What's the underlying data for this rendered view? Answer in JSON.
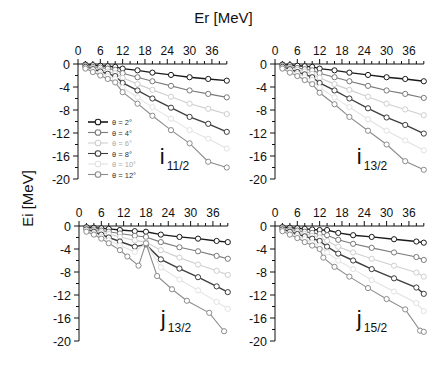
{
  "figure": {
    "xlabel": "Er [MeV]",
    "ylabel": "Ei [MeV]"
  },
  "chart_data": [
    {
      "type": "line",
      "panel": "top-left",
      "title": "i11/2",
      "label_main": "i",
      "label_sub": "11/2",
      "xlabel": "Er [MeV]",
      "ylabel": "Ei [MeV]",
      "xlim": [
        0,
        40
      ],
      "ylim": [
        -20,
        0
      ],
      "xticks": [
        0,
        6,
        12,
        18,
        24,
        30,
        36
      ],
      "yticks": [
        0,
        -4,
        -8,
        -12,
        -16,
        -20
      ],
      "legend": [
        "θ = 2°",
        "θ = 4°",
        "θ = 6°",
        "θ = 8°",
        "θ = 10°",
        "θ = 12°"
      ],
      "series": [
        {
          "name": "θ = 2°",
          "x": [
            2,
            4,
            6,
            8,
            10,
            12,
            16,
            20,
            25,
            30,
            35,
            40
          ],
          "y": [
            -0.1,
            -0.2,
            -0.3,
            -0.4,
            -0.5,
            -0.8,
            -1.1,
            -1.5,
            -1.9,
            -2.3,
            -2.6,
            -2.9
          ]
        },
        {
          "name": "θ = 4°",
          "x": [
            2,
            4,
            6,
            8,
            10,
            12,
            16,
            20,
            25,
            30,
            35,
            40
          ],
          "y": [
            -0.3,
            -0.5,
            -0.6,
            -0.8,
            -1.0,
            -1.6,
            -2.3,
            -3.0,
            -3.8,
            -4.6,
            -5.2,
            -5.8
          ]
        },
        {
          "name": "θ = 6°",
          "x": [
            2,
            4,
            6,
            8,
            10,
            12,
            16,
            20,
            25,
            30,
            35,
            40
          ],
          "y": [
            -0.4,
            -0.7,
            -1.0,
            -1.3,
            -1.6,
            -2.4,
            -3.5,
            -4.5,
            -5.7,
            -6.9,
            -7.8,
            -8.7
          ]
        },
        {
          "name": "θ = 8°",
          "x": [
            2,
            4,
            6,
            8,
            10,
            12,
            16,
            20,
            25,
            30,
            35,
            40
          ],
          "y": [
            -0.5,
            -0.9,
            -1.3,
            -1.7,
            -2.1,
            -3.3,
            -4.6,
            -6.0,
            -7.6,
            -9.2,
            -10.4,
            -11.8
          ]
        },
        {
          "name": "θ = 10°",
          "x": [
            2,
            4,
            6,
            8,
            10,
            12,
            16,
            20,
            25,
            30,
            35,
            40
          ],
          "y": [
            -0.7,
            -1.1,
            -1.6,
            -2.1,
            -2.6,
            -4.1,
            -5.8,
            -7.5,
            -9.5,
            -11.5,
            -13.0,
            -14.7
          ]
        },
        {
          "name": "θ = 12°",
          "x": [
            2,
            4,
            6,
            8,
            10,
            12,
            16,
            20,
            25,
            30,
            35,
            40
          ],
          "y": [
            -0.8,
            -1.4,
            -2.0,
            -2.6,
            -3.2,
            -4.9,
            -6.9,
            -9.0,
            -11.5,
            -13.8,
            -17.0,
            -18.0
          ]
        }
      ]
    },
    {
      "type": "line",
      "panel": "top-right",
      "title": "i13/2",
      "label_main": "i",
      "label_sub": "13/2",
      "xlabel": "Er [MeV]",
      "ylabel": "Ei [MeV]",
      "xlim": [
        0,
        40
      ],
      "ylim": [
        -20,
        0
      ],
      "xticks": [
        0,
        6,
        12,
        18,
        24,
        30,
        36
      ],
      "yticks": [
        0,
        -4,
        -8,
        -12,
        -16,
        -20
      ],
      "series": [
        {
          "name": "θ = 2°",
          "x": [
            2,
            4,
            6,
            8,
            10,
            12,
            16,
            20,
            25,
            30,
            35,
            40
          ],
          "y": [
            -0.1,
            -0.2,
            -0.3,
            -0.4,
            -0.5,
            -0.8,
            -1.1,
            -1.5,
            -1.9,
            -2.3,
            -2.6,
            -3.0
          ]
        },
        {
          "name": "θ = 4°",
          "x": [
            2,
            4,
            6,
            8,
            10,
            12,
            16,
            20,
            25,
            30,
            35,
            40
          ],
          "y": [
            -0.3,
            -0.5,
            -0.7,
            -0.9,
            -1.1,
            -1.6,
            -2.3,
            -3.0,
            -3.8,
            -4.6,
            -5.2,
            -5.9
          ]
        },
        {
          "name": "θ = 6°",
          "x": [
            2,
            4,
            6,
            8,
            10,
            12,
            16,
            20,
            25,
            30,
            35,
            40
          ],
          "y": [
            -0.4,
            -0.7,
            -1.0,
            -1.3,
            -1.7,
            -2.4,
            -3.5,
            -4.5,
            -5.7,
            -6.9,
            -7.9,
            -8.9
          ]
        },
        {
          "name": "θ = 8°",
          "x": [
            2,
            4,
            6,
            8,
            10,
            12,
            16,
            20,
            25,
            30,
            35,
            40
          ],
          "y": [
            -0.5,
            -0.9,
            -1.4,
            -1.8,
            -2.3,
            -3.3,
            -4.6,
            -6.0,
            -7.7,
            -9.3,
            -10.6,
            -12.1
          ]
        },
        {
          "name": "θ = 10°",
          "x": [
            2,
            4,
            6,
            8,
            10,
            12,
            16,
            20,
            25,
            30,
            35,
            40
          ],
          "y": [
            -0.7,
            -1.2,
            -1.7,
            -2.3,
            -2.8,
            -4.1,
            -5.8,
            -7.5,
            -9.6,
            -11.6,
            -13.3,
            -15.0
          ]
        },
        {
          "name": "θ = 12°",
          "x": [
            2,
            4,
            6,
            8,
            10,
            12,
            16,
            20,
            25,
            30,
            35,
            40
          ],
          "y": [
            -0.8,
            -1.5,
            -2.1,
            -2.8,
            -3.5,
            -5.0,
            -7.0,
            -9.2,
            -11.6,
            -14.0,
            -16.9,
            -18.4
          ]
        }
      ]
    },
    {
      "type": "line",
      "panel": "bottom-left",
      "title": "j13/2",
      "label_main": "j",
      "label_sub": "13/2",
      "xlabel": "Er [MeV]",
      "ylabel": "Ei [MeV]",
      "xlim": [
        0,
        40
      ],
      "ylim": [
        -20,
        0
      ],
      "xticks": [
        0,
        6,
        12,
        18,
        24,
        30,
        36
      ],
      "yticks": [
        0,
        -4,
        -8,
        -12,
        -16,
        -20
      ],
      "series": [
        {
          "name": "θ = 2°",
          "x": [
            2,
            4,
            6,
            8,
            11,
            15,
            18,
            22,
            27,
            32,
            37,
            40
          ],
          "y": [
            -0.2,
            -0.3,
            -0.4,
            -0.5,
            -0.7,
            -0.9,
            -1.0,
            -1.5,
            -1.9,
            -2.2,
            -2.6,
            -2.8
          ]
        },
        {
          "name": "θ = 4°",
          "x": [
            2,
            4,
            6,
            8,
            11,
            15,
            18,
            22,
            27,
            32,
            37,
            40
          ],
          "y": [
            -0.4,
            -0.6,
            -0.8,
            -1.0,
            -1.3,
            -1.7,
            -1.9,
            -2.8,
            -3.7,
            -4.4,
            -5.2,
            -5.7
          ]
        },
        {
          "name": "θ = 6°",
          "x": [
            2,
            4,
            6,
            8,
            11,
            15,
            18,
            22,
            27,
            32,
            37,
            40
          ],
          "y": [
            -0.5,
            -0.8,
            -1.1,
            -1.4,
            -1.9,
            -2.5,
            -2.8,
            -4.2,
            -5.5,
            -6.7,
            -7.8,
            -8.5
          ]
        },
        {
          "name": "θ = 8°",
          "x": [
            2,
            4,
            6,
            8,
            11,
            15,
            18,
            22,
            27,
            32,
            37,
            40
          ],
          "y": [
            -0.6,
            -1.0,
            -1.5,
            -2.0,
            -2.7,
            -3.6,
            -3.2,
            -5.8,
            -7.4,
            -8.9,
            -10.5,
            -11.5
          ]
        },
        {
          "name": "θ = 10°",
          "x": [
            2,
            4,
            6,
            8,
            11,
            15,
            18,
            22,
            27,
            32,
            37,
            40
          ],
          "y": [
            -0.8,
            -1.3,
            -1.9,
            -2.5,
            -3.4,
            -4.5,
            -3.0,
            -7.2,
            -9.3,
            -11.2,
            -13.2,
            -14.4
          ]
        },
        {
          "name": "θ = 12°",
          "x": [
            2,
            4,
            6,
            8,
            11,
            13,
            16,
            18,
            21,
            25,
            29,
            35,
            39
          ],
          "y": [
            -1.0,
            -1.5,
            -2.2,
            -3.0,
            -4.2,
            -5.3,
            -6.9,
            -3.0,
            -8.7,
            -11.0,
            -13.0,
            -15.1,
            -18.3
          ]
        }
      ]
    },
    {
      "type": "line",
      "panel": "bottom-right",
      "title": "j15/2",
      "label_main": "j",
      "label_sub": "15/2",
      "xlabel": "Er [MeV]",
      "ylabel": "Ei [MeV]",
      "xlim": [
        0,
        40
      ],
      "ylim": [
        -20,
        0
      ],
      "xticks": [
        0,
        6,
        12,
        18,
        24,
        30,
        36
      ],
      "yticks": [
        0,
        -4,
        -8,
        -12,
        -16,
        -20
      ],
      "series": [
        {
          "name": "θ = 2°",
          "x": [
            2,
            4,
            6,
            8,
            10,
            12,
            14,
            17,
            21,
            26,
            32,
            38,
            40
          ],
          "y": [
            -0.2,
            -0.3,
            -0.4,
            -0.5,
            -0.6,
            -0.7,
            -0.7,
            -1.2,
            -1.6,
            -1.9,
            -2.3,
            -2.7,
            -2.9
          ]
        },
        {
          "name": "θ = 4°",
          "x": [
            2,
            4,
            6,
            8,
            10,
            12,
            14,
            17,
            21,
            26,
            32,
            38,
            40
          ],
          "y": [
            -0.4,
            -0.6,
            -0.8,
            -1.0,
            -1.2,
            -1.4,
            -1.6,
            -2.4,
            -3.1,
            -3.8,
            -4.6,
            -5.4,
            -5.9
          ]
        },
        {
          "name": "θ = 6°",
          "x": [
            2,
            4,
            6,
            8,
            10,
            12,
            14,
            17,
            21,
            26,
            32,
            38,
            40
          ],
          "y": [
            -0.5,
            -0.8,
            -1.1,
            -1.4,
            -1.7,
            -2.0,
            -2.6,
            -3.6,
            -4.6,
            -5.7,
            -6.9,
            -8.1,
            -8.8
          ]
        },
        {
          "name": "θ = 8°",
          "x": [
            2,
            4,
            6,
            8,
            10,
            12,
            14,
            17,
            21,
            26,
            32,
            38,
            40
          ],
          "y": [
            -0.6,
            -1.0,
            -1.4,
            -1.8,
            -2.2,
            -2.6,
            -3.6,
            -4.8,
            -6.0,
            -7.5,
            -9.1,
            -10.7,
            -11.8
          ]
        },
        {
          "name": "θ = 10°",
          "x": [
            2,
            4,
            6,
            8,
            10,
            12,
            14,
            17,
            21,
            26,
            32,
            38,
            40
          ],
          "y": [
            -0.8,
            -1.3,
            -1.8,
            -2.3,
            -2.9,
            -3.4,
            -4.6,
            -6.0,
            -7.5,
            -9.4,
            -11.4,
            -13.4,
            -14.8
          ]
        },
        {
          "name": "θ = 12°",
          "x": [
            2,
            4,
            6,
            8,
            10,
            12,
            13,
            16,
            20,
            25,
            30,
            35,
            39,
            40
          ],
          "y": [
            -0.9,
            -1.5,
            -2.1,
            -2.8,
            -3.4,
            -4.0,
            -5.5,
            -7.1,
            -8.8,
            -10.8,
            -12.7,
            -14.5,
            -18.2,
            -18.4
          ]
        }
      ]
    }
  ],
  "style": {
    "series_colors": [
      "#1a1a1a",
      "#7a7a7a",
      "#cfcfcf",
      "#3e3e3e",
      "#e2e2e2",
      "#8c8c8c"
    ],
    "axis_color": "#111111"
  }
}
